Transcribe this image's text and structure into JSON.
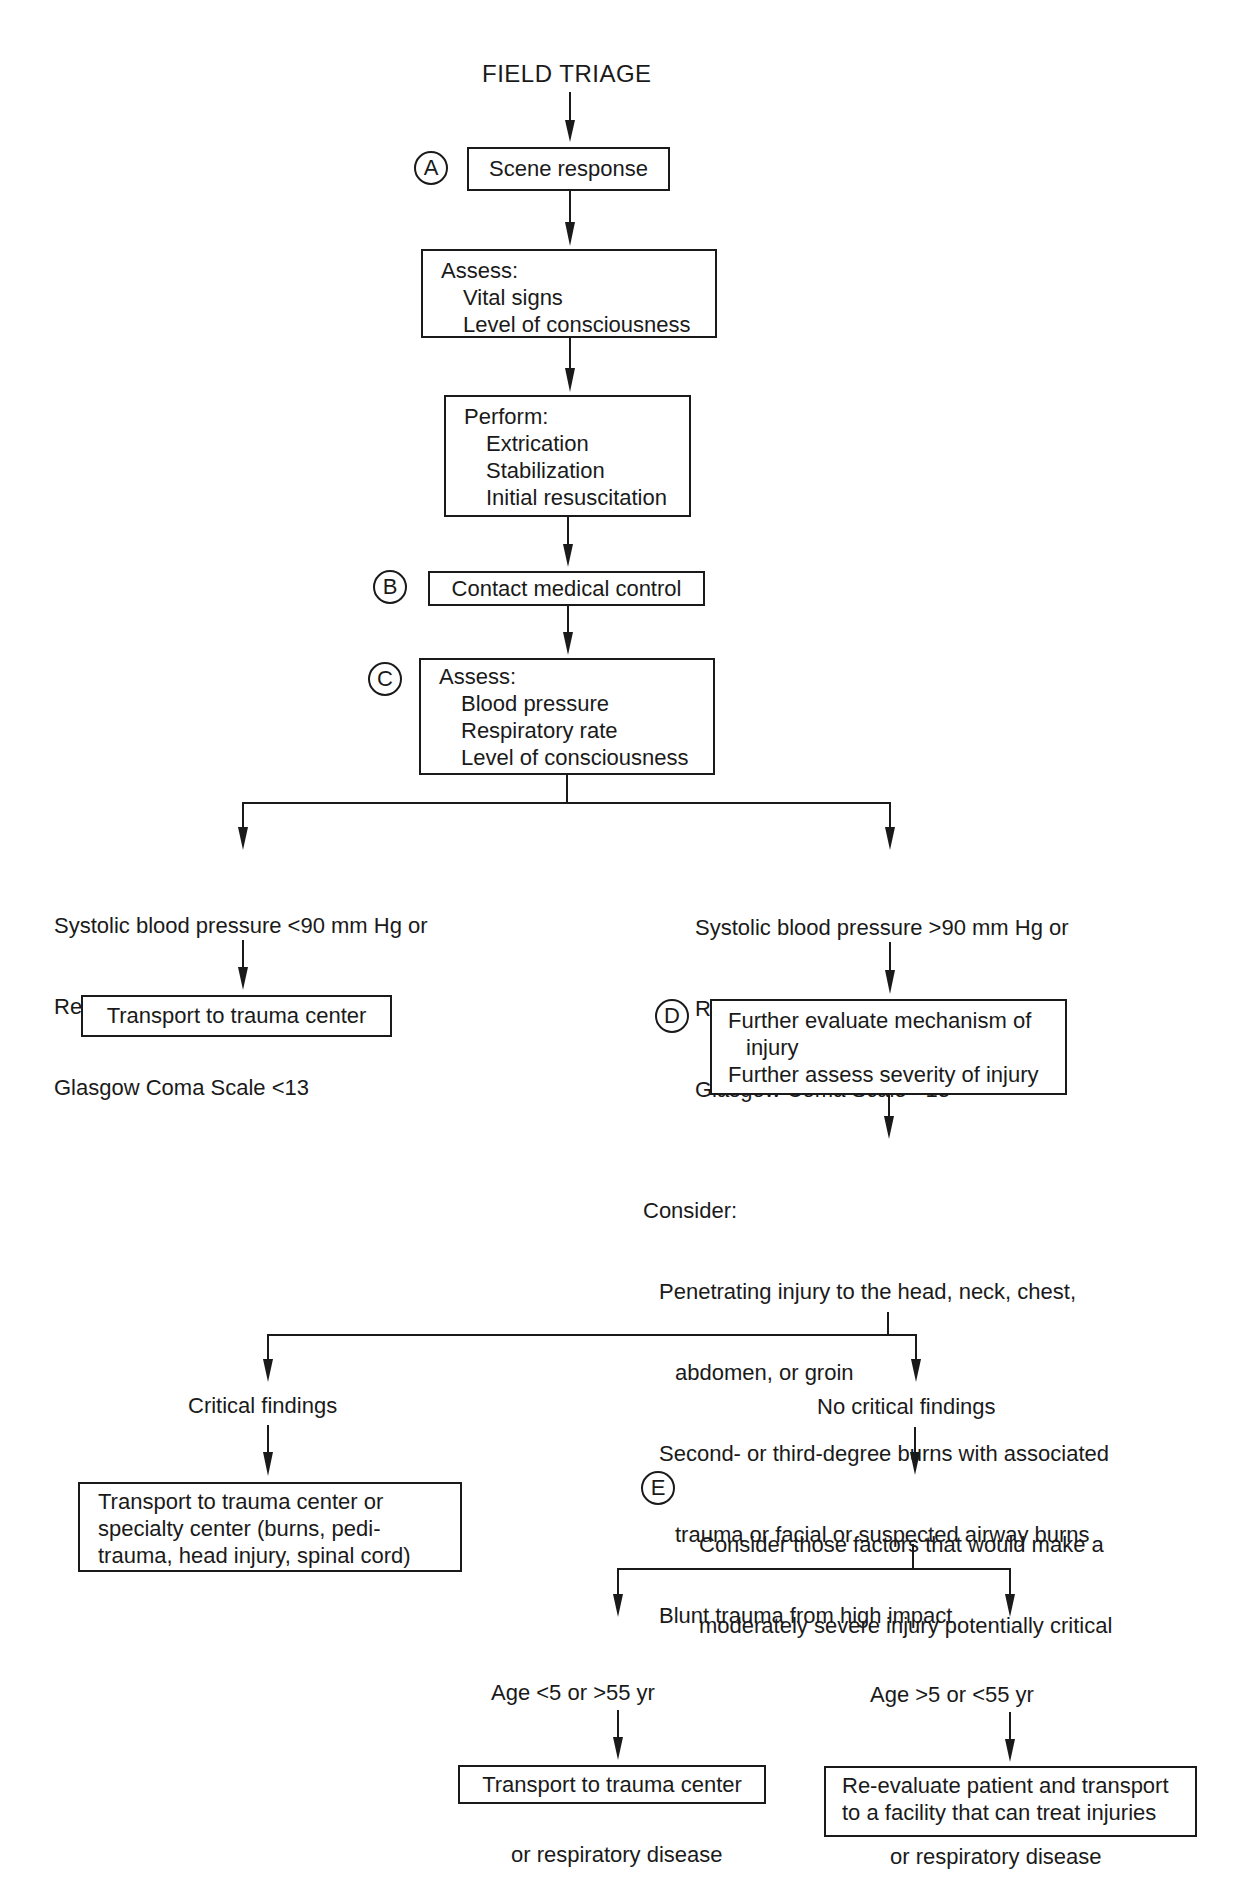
{
  "title": "FIELD TRIAGE",
  "steps": {
    "scene": {
      "marker": "A",
      "label": "Scene response"
    },
    "assess1": {
      "lines": [
        "Assess:",
        "Vital signs",
        "Level of consciousness"
      ]
    },
    "perform": {
      "lines": [
        "Perform:",
        "Extrication",
        "Stabilization",
        "Initial resuscitation"
      ]
    },
    "contact": {
      "marker": "B",
      "label": "Contact medical control"
    },
    "assess2": {
      "marker": "C",
      "lines": [
        "Assess:",
        "Blood pressure",
        "Respiratory rate",
        "Level of consciousness"
      ]
    }
  },
  "branch1": {
    "left": {
      "criteria": [
        "Systolic blood pressure <90 mm Hg or",
        "Respiratory rate <10 or >29 or",
        "Glasgow Coma Scale <13"
      ],
      "outcome": "Transport to trauma center"
    },
    "right": {
      "criteria": [
        "Systolic blood pressure >90 mm Hg or",
        "Respiratory rate >10 or <29 or",
        "Glasgow Coma Scale >13"
      ],
      "evaluate": {
        "marker": "D",
        "lines": [
          "Further evaluate mechanism of",
          "injury",
          "Further assess severity of injury"
        ]
      },
      "consider": {
        "heading": "Consider:",
        "items": [
          [
            "Penetrating injury to the head, neck, chest,",
            "abdomen, or groin"
          ],
          [
            "Second- or third-degree burns with associated",
            "trauma or facial or suspected airway burns"
          ],
          [
            "Blunt trauma from high impact"
          ]
        ]
      }
    }
  },
  "branch2": {
    "critical": {
      "label": "Critical findings",
      "outcome": [
        "Transport to trauma center or",
        "specialty center (burns, pedi-",
        "trauma, head injury, spinal cord)"
      ]
    },
    "no_critical": {
      "label": "No critical findings",
      "factors": {
        "marker": "E",
        "lines": [
          "Consider those factors that would make a",
          "moderately severe injury potentially critical"
        ]
      }
    }
  },
  "branch3": {
    "left": {
      "criteria": [
        "Age <5 or >55 yr",
        "History of known cardiac",
        "or respiratory disease"
      ],
      "outcome": "Transport to trauma center"
    },
    "right": {
      "criteria": [
        "Age >5 or <55 yr",
        "No history of known cardiac",
        "or respiratory disease"
      ],
      "outcome": [
        "Re-evaluate patient and transport",
        "to a facility that can treat injuries"
      ]
    }
  },
  "colors": {
    "ink": "#1a1a1a",
    "background": "#ffffff"
  }
}
